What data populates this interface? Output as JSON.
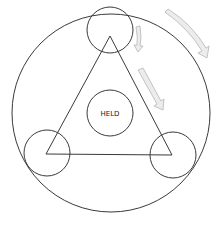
{
  "diagram": {
    "center_label": "HELD",
    "colors": {
      "line": "#3a3a3a",
      "arrow_fill": "#ececec",
      "arrow_stroke": "#b5b5b5",
      "background": "#ffffff"
    },
    "outer_circle": {
      "cx": 111,
      "cy": 113,
      "r": 99
    },
    "triangle": {
      "points": [
        [
          110,
          36
        ],
        [
          46,
          154
        ],
        [
          172,
          155
        ]
      ]
    },
    "vertex_circles": [
      {
        "name": "top",
        "cx": 110,
        "cy": 30,
        "r": 23
      },
      {
        "name": "bottom-left",
        "cx": 47,
        "cy": 153,
        "r": 23
      },
      {
        "name": "bottom-right",
        "cx": 173,
        "cy": 155,
        "r": 23
      }
    ],
    "center_circle": {
      "cx": 110,
      "cy": 113,
      "r": 23
    },
    "arrows": [
      {
        "name": "outer-clockwise-arrow",
        "direction": "clockwise along outer circle"
      },
      {
        "name": "small-rotation-arrow",
        "direction": "downward beside top circle"
      },
      {
        "name": "edge-arrow",
        "direction": "down along right edge of triangle"
      }
    ]
  }
}
